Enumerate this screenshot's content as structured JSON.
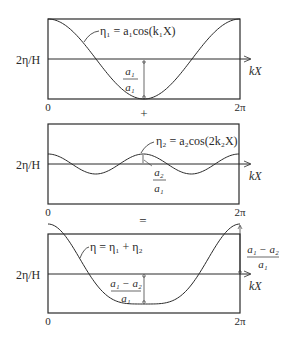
{
  "diagram": {
    "colors": {
      "line": "#2a2a2a",
      "background": "#ffffff"
    },
    "operators": {
      "plus": "+",
      "equals": "="
    },
    "panels": [
      {
        "id": "panel-1",
        "y_axis_label": "2η/H",
        "x_axis_label": "kX",
        "x_start_label": "0",
        "x_end_label": "2π",
        "curve_label": "η₁ = a₁cos(k₁X)",
        "amplitude_label": {
          "numerator": "a₁",
          "denominator": "a₁"
        }
      },
      {
        "id": "panel-2",
        "y_axis_label": "2η/H",
        "x_axis_label": "kX",
        "x_start_label": "0",
        "x_end_label": "2π",
        "curve_label": "η₂ = a₂cos(2k₂X)",
        "amplitude_label": {
          "numerator": "a₂",
          "denominator": "a₁"
        }
      },
      {
        "id": "panel-3",
        "y_axis_label": "2η/H",
        "x_axis_label": "kX",
        "x_start_label": "0",
        "x_end_label": "2π",
        "curve_label": "η = η₁ + η₂",
        "amplitude_label": {
          "numerator": "a₁ − a₂",
          "denominator": "a₁"
        },
        "crest_label": {
          "numerator": "a₁ − a₂",
          "denominator": "a₁"
        }
      }
    ]
  }
}
